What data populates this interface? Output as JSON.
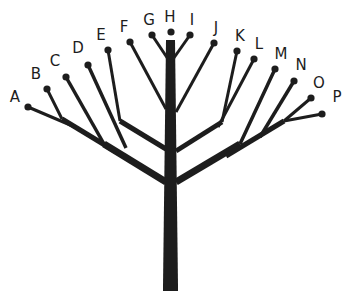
{
  "figure": {
    "name": "branching-tree-diagram",
    "type": "diagram",
    "background_color": "#ffffff",
    "ink_color": "#1d1d1d"
  },
  "trunk": {
    "label": "trunk",
    "top_x": 170.5,
    "top_y": 40,
    "bottom_y": 291,
    "width_top": 9,
    "width_bottom": 15,
    "left_x": 163,
    "right_x": 178
  },
  "tips": [
    {
      "id": "A",
      "label": "A",
      "dot_x": 28,
      "dot_y": 107,
      "label_x": 15,
      "label_y": 97,
      "side": "left"
    },
    {
      "id": "B",
      "label": "B",
      "dot_x": 47,
      "dot_y": 89,
      "label_x": 36,
      "label_y": 74,
      "side": "left"
    },
    {
      "id": "C",
      "label": "C",
      "dot_x": 66,
      "dot_y": 77,
      "label_x": 55,
      "label_y": 61,
      "side": "left"
    },
    {
      "id": "D",
      "label": "D",
      "dot_x": 88,
      "dot_y": 65,
      "label_x": 78,
      "label_y": 48,
      "side": "left"
    },
    {
      "id": "E",
      "label": "E",
      "dot_x": 108,
      "dot_y": 50,
      "label_x": 101,
      "label_y": 35,
      "side": "left"
    },
    {
      "id": "F",
      "label": "F",
      "dot_x": 130,
      "dot_y": 42,
      "label_x": 124,
      "label_y": 27,
      "side": "left"
    },
    {
      "id": "G",
      "label": "G",
      "dot_x": 152,
      "dot_y": 35,
      "label_x": 149,
      "label_y": 20,
      "side": "left"
    },
    {
      "id": "H",
      "label": "H",
      "dot_x": 171,
      "dot_y": 32,
      "label_x": 170,
      "label_y": 17,
      "side": "center"
    },
    {
      "id": "I",
      "label": "I",
      "dot_x": 190,
      "dot_y": 35,
      "label_x": 192,
      "label_y": 20,
      "side": "right"
    },
    {
      "id": "J",
      "label": "J",
      "dot_x": 214,
      "dot_y": 43,
      "label_x": 216,
      "label_y": 28,
      "side": "right"
    },
    {
      "id": "K",
      "label": "K",
      "dot_x": 237,
      "dot_y": 51,
      "label_x": 240,
      "label_y": 36,
      "side": "right"
    },
    {
      "id": "L",
      "label": "L",
      "dot_x": 254,
      "dot_y": 59,
      "label_x": 259,
      "label_y": 44,
      "side": "right"
    },
    {
      "id": "M",
      "label": "M",
      "dot_x": 275,
      "dot_y": 69,
      "label_x": 281,
      "label_y": 54,
      "side": "right"
    },
    {
      "id": "N",
      "label": "N",
      "dot_x": 294,
      "dot_y": 81,
      "label_x": 301,
      "label_y": 65,
      "side": "right"
    },
    {
      "id": "O",
      "label": "O",
      "dot_x": 311,
      "dot_y": 98,
      "label_x": 319,
      "label_y": 83,
      "side": "right"
    },
    {
      "id": "P",
      "label": "P",
      "dot_x": 322,
      "dot_y": 114,
      "label_x": 337,
      "label_y": 97,
      "side": "right"
    }
  ],
  "branches": [
    {
      "id": "main-left",
      "from_x": 166,
      "from_y": 182,
      "to_x": 104,
      "to_y": 144,
      "width": 7
    },
    {
      "id": "left-sub-AB",
      "from_x": 118,
      "from_y": 153,
      "to_x": 62,
      "to_y": 119,
      "width": 5
    },
    {
      "id": "twig-A",
      "from_x": 75,
      "from_y": 127,
      "to_x": 28,
      "to_y": 107,
      "width": 3
    },
    {
      "id": "twig-B",
      "from_x": 62,
      "from_y": 119,
      "to_x": 47,
      "to_y": 89,
      "width": 3
    },
    {
      "id": "twig-C",
      "from_x": 104,
      "from_y": 144,
      "to_x": 66,
      "to_y": 77,
      "width": 3.5
    },
    {
      "id": "twig-D",
      "from_x": 126,
      "from_y": 148,
      "to_x": 88,
      "to_y": 65,
      "width": 3.5
    },
    {
      "id": "left-upper-spine",
      "from_x": 166,
      "from_y": 149,
      "to_x": 120,
      "to_y": 121,
      "width": 5
    },
    {
      "id": "twig-E",
      "from_x": 120,
      "from_y": 121,
      "to_x": 108,
      "to_y": 50,
      "width": 3
    },
    {
      "id": "twig-F",
      "from_x": 166,
      "from_y": 109,
      "to_x": 130,
      "to_y": 42,
      "width": 3
    },
    {
      "id": "twig-G",
      "from_x": 170,
      "from_y": 62,
      "to_x": 152,
      "to_y": 35,
      "width": 3
    },
    {
      "id": "twig-I",
      "from_x": 171,
      "from_y": 62,
      "to_x": 190,
      "to_y": 35,
      "width": 3
    },
    {
      "id": "twig-J",
      "from_x": 176,
      "from_y": 112,
      "to_x": 214,
      "to_y": 43,
      "width": 3
    },
    {
      "id": "right-upper-spine",
      "from_x": 176,
      "from_y": 151,
      "to_x": 222,
      "to_y": 122,
      "width": 5
    },
    {
      "id": "twig-K",
      "from_x": 222,
      "from_y": 122,
      "to_x": 237,
      "to_y": 51,
      "width": 3
    },
    {
      "id": "twig-L",
      "from_x": 218,
      "from_y": 127,
      "to_x": 254,
      "to_y": 59,
      "width": 3
    },
    {
      "id": "main-right",
      "from_x": 176,
      "from_y": 182,
      "to_x": 240,
      "to_y": 144,
      "width": 7
    },
    {
      "id": "twig-M",
      "from_x": 240,
      "from_y": 144,
      "to_x": 275,
      "to_y": 69,
      "width": 3.5
    },
    {
      "id": "right-sub-OP",
      "from_x": 226,
      "from_y": 156,
      "to_x": 284,
      "to_y": 121,
      "width": 5
    },
    {
      "id": "twig-N",
      "from_x": 260,
      "from_y": 137,
      "to_x": 294,
      "to_y": 81,
      "width": 3.5
    },
    {
      "id": "twig-O",
      "from_x": 284,
      "from_y": 121,
      "to_x": 311,
      "to_y": 98,
      "width": 3
    },
    {
      "id": "twig-P",
      "from_x": 284,
      "from_y": 121,
      "to_x": 322,
      "to_y": 114,
      "width": 3
    }
  ],
  "dot_radius": 3.6
}
